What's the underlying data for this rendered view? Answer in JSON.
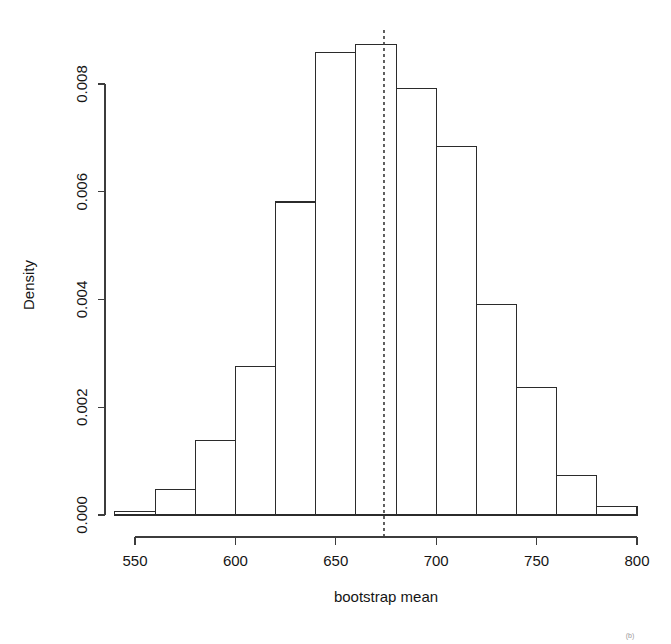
{
  "chart_data": {
    "type": "bar",
    "subtype": "histogram",
    "title": "",
    "xlabel": "bootstrap mean",
    "ylabel": "Density",
    "xlim": [
      540,
      800
    ],
    "ylim": [
      0.0,
      0.0088
    ],
    "grid": false,
    "legend": null,
    "bin_width": 20,
    "bin_edges": [
      540,
      560,
      580,
      600,
      620,
      640,
      660,
      680,
      700,
      720,
      740,
      760,
      780,
      800
    ],
    "categories": [
      "540-560",
      "560-580",
      "580-600",
      "600-620",
      "620-640",
      "640-660",
      "660-680",
      "680-700",
      "700-720",
      "720-740",
      "740-760",
      "760-780",
      "780-800"
    ],
    "values": [
      7e-05,
      0.00047,
      0.00138,
      0.00276,
      0.00581,
      0.00859,
      0.00873,
      0.00791,
      0.00684,
      0.0039,
      0.00236,
      0.00074,
      0.00015
    ],
    "xticks": [
      550,
      600,
      650,
      700,
      750,
      800
    ],
    "xtick_labels": [
      "550",
      "600",
      "650",
      "700",
      "750",
      "800"
    ],
    "yticks": [
      0.0,
      0.002,
      0.004,
      0.006,
      0.008
    ],
    "ytick_labels": [
      "0.000",
      "0.002",
      "0.004",
      "0.006",
      "0.008"
    ],
    "annotations": [
      {
        "name": "observed-mean-line",
        "type": "vertical-dashed-line",
        "x": 674,
        "style": "dashed",
        "color": "#3a3a3a"
      }
    ],
    "colors": {
      "bar_fill": "#ffffff",
      "bar_stroke": "#2b2b2b",
      "axis": "#3c3c3c",
      "text": "#151515",
      "background": "#ffffff",
      "annotation_line": "#3a3a3a"
    }
  },
  "artifacts": {
    "corner_mark": "(b)"
  }
}
